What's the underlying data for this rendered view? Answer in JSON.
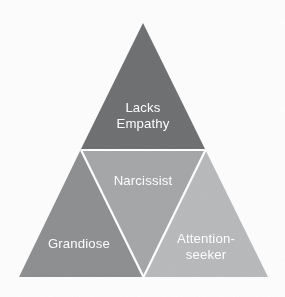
{
  "diagram": {
    "type": "nested-triangle",
    "background_color": "#fdfdfd",
    "divider_color": "#ffffff",
    "divider_width": 2.2,
    "label_color": "#ffffff",
    "outer_triangle": {
      "apex": {
        "x": 143,
        "y": 23
      },
      "bottom_left": {
        "x": 19,
        "y": 277
      },
      "bottom_right": {
        "x": 268,
        "y": 277
      }
    },
    "regions": [
      {
        "id": "top",
        "name": "lacks-empathy",
        "label_lines": [
          "Lacks",
          "Empathy"
        ],
        "color": "#6f7173",
        "points": "143,23 80.5,150 205.5,150",
        "label_x": 143,
        "label_y": 112,
        "line_height": 15.5
      },
      {
        "id": "center",
        "name": "narcissist",
        "label_lines": [
          "Narcissist"
        ],
        "color": "#a5a7a8",
        "points": "80.5,150 205.5,150 143,277",
        "label_x": 143,
        "label_y": 185,
        "line_height": 15.5
      },
      {
        "id": "bottom-left",
        "name": "grandiose",
        "label_lines": [
          "Grandiose"
        ],
        "color": "#8e9092",
        "points": "19,277 80.5,150 143,277",
        "label_x": 79,
        "label_y": 248,
        "line_height": 15.5
      },
      {
        "id": "bottom-right",
        "name": "attention-seeker",
        "label_lines": [
          "Attention-",
          "seeker"
        ],
        "color": "#b8babb",
        "points": "143,277 205.5,150 268,277",
        "label_x": 206,
        "label_y": 243,
        "line_height": 15.5
      }
    ]
  }
}
